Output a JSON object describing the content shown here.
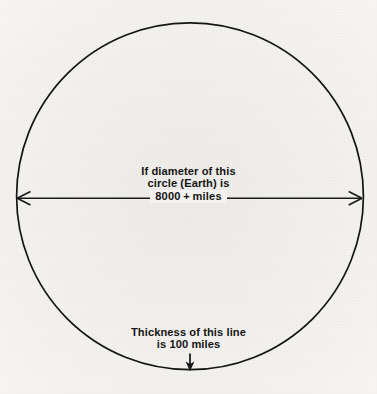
{
  "figure": {
    "background_color": "#f7f6f4",
    "ink_color": "#151515"
  },
  "shapes": {
    "circle": {
      "name": "earth-circle",
      "center_x": 190,
      "center_y": 196,
      "radius": 173.5,
      "stroke_width": 1.6
    },
    "diameter_line": {
      "name": "diameter-line",
      "y": 198,
      "x_start": 16,
      "x_end": 363,
      "stroke_width": 1.5,
      "arrowheads": "both-ends-open-v"
    },
    "thickness_arrow": {
      "name": "thickness-arrow",
      "x": 190,
      "y_start": 354,
      "y_end": 371,
      "stroke_width": 1.6,
      "arrowhead": "down-solid"
    }
  },
  "diameter_label": {
    "line1": "If diameter of this",
    "line2": "circle (Earth) is",
    "value": "8000",
    "plus": "+",
    "unit": "miles"
  },
  "thickness_label": {
    "line1": "Thickness of this line",
    "line2": "is 100 miles"
  }
}
